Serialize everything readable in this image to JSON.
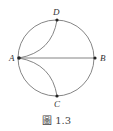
{
  "figure": {
    "caption": "圖 1.3",
    "stroke_color": "#777777",
    "point_color": "#222222",
    "circle": {
      "cx": 56,
      "cy": 58,
      "r": 38
    },
    "points": {
      "A": {
        "label": "A",
        "x": 19,
        "y": 58
      },
      "B": {
        "label": "B",
        "x": 95,
        "y": 58
      },
      "C": {
        "label": "C",
        "x": 57,
        "y": 96
      },
      "D": {
        "label": "D",
        "x": 57,
        "y": 20
      }
    },
    "edges": [
      "A-B chord",
      "A-D arc",
      "A-C arc"
    ]
  }
}
